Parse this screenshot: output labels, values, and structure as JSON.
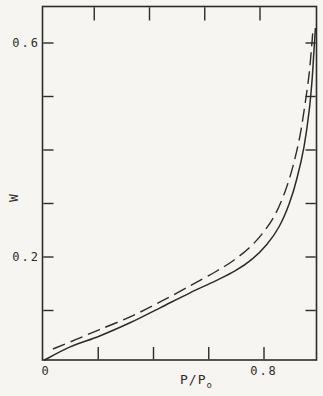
{
  "figure": {
    "background": "#f6f5f1",
    "line_color": "#2c2b28",
    "text_color": "#2e2d2a"
  },
  "chart_data": {
    "type": "line",
    "title": "",
    "xlabel": "P/P",
    "xlabel_sub": "o",
    "ylabel": "W",
    "xlim": [
      0,
      0.99
    ],
    "ylim": [
      0,
      0.67
    ],
    "grid": false,
    "legend": null,
    "x_ticks": [
      0.2,
      0.4,
      0.6,
      0.8
    ],
    "y_ticks": [
      0.1,
      0.2,
      0.3,
      0.4,
      0.5,
      0.6
    ],
    "x_tick_labels": [
      {
        "value": 0,
        "label": "0"
      },
      {
        "value": 0.8,
        "label": "0.8"
      }
    ],
    "y_tick_labels": [
      {
        "value": 0.2,
        "label": "0.2"
      },
      {
        "value": 0.6,
        "label": "0.6"
      }
    ],
    "series": [
      {
        "name": "solid-isotherm",
        "style": "solid",
        "x": [
          0.004,
          0.098,
          0.203,
          0.315,
          0.424,
          0.532,
          0.623,
          0.695,
          0.757,
          0.811,
          0.854,
          0.891,
          0.92,
          0.945,
          0.963,
          0.974,
          0.981,
          0.986
        ],
        "y": [
          0.007,
          0.032,
          0.052,
          0.077,
          0.105,
          0.133,
          0.155,
          0.174,
          0.196,
          0.224,
          0.256,
          0.299,
          0.348,
          0.407,
          0.471,
          0.531,
          0.587,
          0.628
        ]
      },
      {
        "name": "dashed-isotherm",
        "style": "dashed",
        "x": [
          0.036,
          0.116,
          0.203,
          0.315,
          0.424,
          0.532,
          0.623,
          0.688,
          0.746,
          0.796,
          0.84,
          0.876,
          0.905,
          0.93,
          0.948,
          0.963,
          0.972,
          0.977
        ],
        "y": [
          0.028,
          0.045,
          0.064,
          0.088,
          0.116,
          0.146,
          0.172,
          0.193,
          0.217,
          0.245,
          0.279,
          0.322,
          0.37,
          0.426,
          0.484,
          0.54,
          0.591,
          0.624
        ]
      }
    ]
  }
}
